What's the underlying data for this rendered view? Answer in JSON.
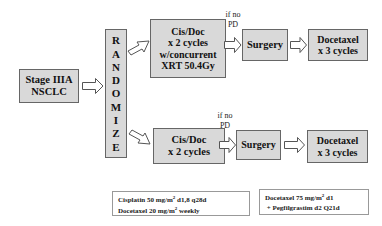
{
  "diagram": {
    "start": {
      "line1": "Stage IIIA",
      "line2": "NSCLC"
    },
    "randomize": [
      "R",
      "A",
      "N",
      "D",
      "O",
      "M",
      "I",
      "Z",
      "E"
    ],
    "arm_a": {
      "chemo": {
        "line1": "Cis/Doc",
        "line2": "x 2 cycles",
        "line3": "w/concurrent",
        "line4": "XRT 50.4Gy"
      },
      "condition": {
        "line1": "if no",
        "line2": "PD"
      },
      "surgery": "Surgery",
      "docetaxel": {
        "line1": "Docetaxel",
        "line2": "x 3 cycles"
      }
    },
    "arm_b": {
      "chemo": {
        "line1": "Cis/Doc",
        "line2": "x 2 cycles"
      },
      "condition": {
        "line1": "if no",
        "line2": "PD"
      },
      "surgery": "Surgery",
      "docetaxel": {
        "line1": "Docetaxel",
        "line2": "x 3 cycles"
      }
    },
    "notes": {
      "induction": {
        "line1_pre": "Cisplatin 50 mg/m",
        "line1_sup": "2",
        "line1_post": " d1,8 q28d",
        "line2_pre": "Docetaxel 20 mg/m",
        "line2_sup": "2",
        "line2_post": " weekly"
      },
      "consolidation": {
        "line1_pre": "Docetaxel 75 mg/m",
        "line1_sup": "2",
        "line1_post": " d1",
        "line2": " + Pegfilgrastim d2 Q21d"
      }
    },
    "colors": {
      "box_fill": "#d9d9d9",
      "box_border": "#666666",
      "background": "#ffffff"
    }
  }
}
